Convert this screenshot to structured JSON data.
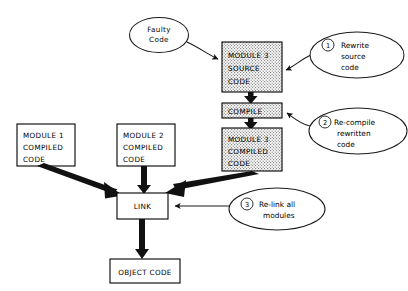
{
  "diagram": {
    "colors": {
      "stroke": "#000000",
      "fill_plain": "#ffffff",
      "fill_stipple": "#d0d0d0",
      "background": "#ffffff"
    },
    "nodes": [
      {
        "id": "faulty-code",
        "shape": "ellipse",
        "lines": [
          "Faulty",
          "Code"
        ],
        "fill": "plain"
      },
      {
        "id": "module3-source-code",
        "shape": "box",
        "lines": [
          "MODULE 3",
          "SOURCE",
          "CODE"
        ],
        "fill": "stipple"
      },
      {
        "id": "compile",
        "shape": "box",
        "lines": [
          "COMPILE"
        ],
        "fill": "stipple"
      },
      {
        "id": "module3-compiled-code",
        "shape": "box",
        "lines": [
          "MODULE 3",
          "COMPILED",
          "CODE"
        ],
        "fill": "stipple"
      },
      {
        "id": "module1-compiled-code",
        "shape": "box",
        "lines": [
          "MODULE 1",
          "COMPILED",
          "CODE"
        ],
        "fill": "plain"
      },
      {
        "id": "module2-compiled-code",
        "shape": "box",
        "lines": [
          "MODULE 2",
          "COMPILED",
          "CODE"
        ],
        "fill": "plain"
      },
      {
        "id": "link",
        "shape": "box",
        "lines": [
          "LINK"
        ],
        "fill": "plain"
      },
      {
        "id": "object-code",
        "shape": "box",
        "lines": [
          "OBJECT CODE"
        ],
        "fill": "plain"
      }
    ],
    "callouts": [
      {
        "id": "callout-1",
        "number": "1",
        "lines": [
          "Rewrite",
          "source",
          "code"
        ],
        "target": "module3-source-code"
      },
      {
        "id": "callout-2",
        "number": "2",
        "lines": [
          "Re-compile",
          "rewritten",
          "code"
        ],
        "target": "compile"
      },
      {
        "id": "callout-3",
        "number": "3",
        "lines": [
          "Re-link all",
          "modules"
        ],
        "target": "link"
      }
    ],
    "edges": [
      {
        "from": "faulty-code",
        "to": "module3-source-code",
        "style": "thin-curve-arrow"
      },
      {
        "from": "module3-source-code",
        "to": "compile",
        "style": "thick-arrow"
      },
      {
        "from": "compile",
        "to": "module3-compiled-code",
        "style": "thick-arrow"
      },
      {
        "from": "module1-compiled-code",
        "to": "link",
        "style": "thick-arrow"
      },
      {
        "from": "module2-compiled-code",
        "to": "link",
        "style": "thick-arrow"
      },
      {
        "from": "module3-compiled-code",
        "to": "link",
        "style": "thick-arrow"
      },
      {
        "from": "link",
        "to": "object-code",
        "style": "thick-arrow"
      },
      {
        "from": "callout-1",
        "to": "module3-source-code",
        "style": "thin-curve-arrow"
      },
      {
        "from": "callout-2",
        "to": "compile",
        "style": "thin-curve-arrow"
      },
      {
        "from": "callout-3",
        "to": "link",
        "style": "thin-line-arrow"
      }
    ]
  }
}
